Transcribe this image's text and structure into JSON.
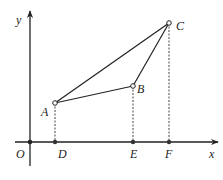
{
  "diagram": {
    "colors": {
      "stroke": "#222222",
      "background": "#ffffff"
    },
    "axes": {
      "origin": {
        "label": "O",
        "x": 30,
        "y": 142
      },
      "x_axis": {
        "label": "x",
        "from": 15,
        "to": 218
      },
      "y_axis": {
        "label": "y",
        "from": 166,
        "to": 11
      }
    },
    "points": {
      "A": {
        "label": "A",
        "x": 55,
        "y": 103
      },
      "B": {
        "label": "B",
        "x": 133,
        "y": 86
      },
      "C": {
        "label": "C",
        "x": 169,
        "y": 23
      },
      "D": {
        "label": "D",
        "x": 55,
        "y": 142
      },
      "E": {
        "label": "E",
        "x": 133,
        "y": 142
      },
      "F": {
        "label": "F",
        "x": 169,
        "y": 142
      }
    },
    "segments": [
      {
        "from": "A",
        "to": "B",
        "style": "solid"
      },
      {
        "from": "B",
        "to": "C",
        "style": "solid"
      },
      {
        "from": "A",
        "to": "C",
        "style": "solid"
      },
      {
        "from": "A",
        "to": "D",
        "style": "dashed"
      },
      {
        "from": "B",
        "to": "E",
        "style": "dashed"
      },
      {
        "from": "C",
        "to": "F",
        "style": "dashed"
      }
    ]
  }
}
